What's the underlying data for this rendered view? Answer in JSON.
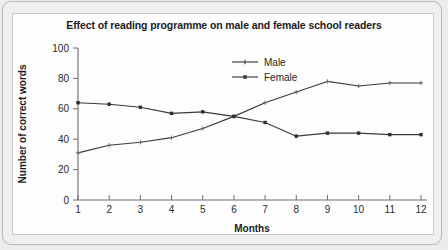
{
  "chart_data": {
    "type": "line",
    "title": "Effect of reading programme on male and female school readers",
    "xlabel": "Months",
    "ylabel": "Number of correct words",
    "x": [
      1,
      2,
      3,
      4,
      5,
      6,
      7,
      8,
      9,
      10,
      11,
      12
    ],
    "xtick_labels": [
      "1",
      "2",
      "3",
      "4",
      "5",
      "6",
      "7",
      "8",
      "9",
      "10",
      "11",
      "12"
    ],
    "ytick_labels": [
      "0",
      "20",
      "40",
      "60",
      "80",
      "100"
    ],
    "yticks": [
      0,
      20,
      40,
      60,
      80,
      100
    ],
    "ylim": [
      0,
      100
    ],
    "xlim": [
      1,
      12
    ],
    "grid": false,
    "legend_position": "top-center-right",
    "series": [
      {
        "name": "Male",
        "marker": "plus",
        "color": "#3a3a3a",
        "values": [
          31,
          36,
          38,
          41,
          47,
          55,
          64,
          71,
          78,
          75,
          77,
          77
        ]
      },
      {
        "name": "Female",
        "marker": "square",
        "color": "#3a3a3a",
        "values": [
          64,
          63,
          61,
          57,
          58,
          55,
          51,
          42,
          44,
          44,
          43,
          43
        ]
      }
    ]
  },
  "colors": {
    "page_background": "#ececeb",
    "panel_background": "#fdfdfd",
    "panel_border": "#c9c9c6",
    "axis": "#6e6e6e",
    "line": "#3a3a3a",
    "text": "#1c1c1c"
  }
}
